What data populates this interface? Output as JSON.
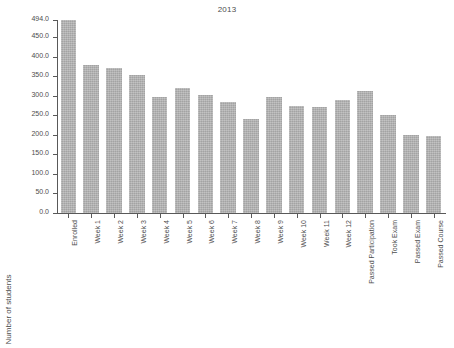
{
  "chart_data": {
    "type": "bar",
    "title": "2013",
    "xlabel": "",
    "ylabel": "Number of students",
    "ylim": [
      0,
      494
    ],
    "grid": false,
    "legend": null,
    "ytick_labels": [
      "0.0",
      "50.0",
      "100.0",
      "150.0",
      "200.0",
      "250.0",
      "300.0",
      "350.0",
      "400.0",
      "450.0",
      "494.0"
    ],
    "ytick_values": [
      0,
      50,
      100,
      150,
      200,
      250,
      300,
      350,
      400,
      450,
      494
    ],
    "categories": [
      "Enrolled",
      "Week 1",
      "Week 2",
      "Week 3",
      "Week 4",
      "Week 5",
      "Week 6",
      "Week 7",
      "Week 8",
      "Week 9",
      "Week 10",
      "Week 11",
      "Week 12",
      "Passed Participation",
      "Took Exam",
      "Passed Exam",
      "Passed Course"
    ],
    "values": [
      494,
      378,
      370,
      352,
      298,
      321,
      302,
      284,
      241,
      298,
      273,
      271,
      290,
      313,
      252,
      200,
      198
    ],
    "bar_color": "#b3b3b3"
  }
}
